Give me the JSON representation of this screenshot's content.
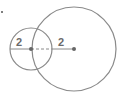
{
  "diagram": {
    "stroke_color": "#8a8a8a",
    "label_color": "#6a6a6a",
    "small_circle": {
      "cx": 31,
      "cy": 49,
      "r": 21,
      "radius_label": "2"
    },
    "large_circle": {
      "cx": 74,
      "cy": 49,
      "r": 42,
      "radius_label": "2"
    },
    "stray_dot": {
      "cx": 2,
      "cy": 12
    }
  }
}
